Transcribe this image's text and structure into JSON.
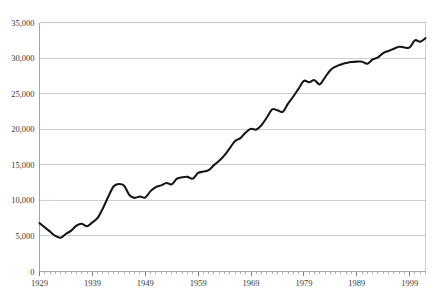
{
  "chart_data": {
    "type": "line",
    "title": "",
    "subtitle": "",
    "xlabel": "",
    "ylabel": "",
    "grid": "horizontal",
    "legend": "none",
    "xlim": [
      1929,
      2002
    ],
    "ylim": [
      0,
      35000
    ],
    "ytick_labels": [
      "0",
      "5,000",
      "10,000",
      "15,000",
      "20,000",
      "25,000",
      "30,000",
      "35,000"
    ],
    "ytick_values": [
      0,
      5000,
      10000,
      15000,
      20000,
      25000,
      30000,
      35000
    ],
    "xtick_labels": [
      "1929",
      "1939",
      "1949",
      "1959",
      "1969",
      "1979",
      "1989",
      "1999"
    ],
    "xtick_values": [
      1929,
      1939,
      1949,
      1959,
      1969,
      1979,
      1989,
      1999
    ],
    "minor_xtick_interval": 1,
    "series": [
      {
        "name": "Series 1",
        "color": "#151515",
        "x": [
          1929,
          1930,
          1931,
          1932,
          1933,
          1934,
          1935,
          1936,
          1937,
          1938,
          1939,
          1940,
          1941,
          1942,
          1943,
          1944,
          1945,
          1946,
          1947,
          1948,
          1949,
          1950,
          1951,
          1952,
          1953,
          1954,
          1955,
          1956,
          1957,
          1958,
          1959,
          1960,
          1961,
          1962,
          1963,
          1964,
          1965,
          1966,
          1967,
          1968,
          1969,
          1970,
          1971,
          1972,
          1973,
          1974,
          1975,
          1976,
          1977,
          1978,
          1979,
          1980,
          1981,
          1982,
          1983,
          1984,
          1985,
          1986,
          1987,
          1988,
          1989,
          1990,
          1991,
          1992,
          1993,
          1994,
          1995,
          1996,
          1997,
          1998,
          1999,
          2000,
          2001,
          2002
        ],
        "values": [
          6800,
          6150,
          5700,
          4900,
          4750,
          5250,
          5700,
          6450,
          6700,
          6400,
          6900,
          7500,
          8800,
          10400,
          11900,
          12350,
          12100,
          10700,
          10350,
          10600,
          10450,
          11350,
          11900,
          12150,
          12500,
          12300,
          13100,
          13300,
          13350,
          13100,
          13900,
          14100,
          14300,
          15000,
          15600,
          16400,
          17400,
          18400,
          18800,
          19600,
          20100,
          20000,
          20650,
          21700,
          22900,
          22700,
          22500,
          23700,
          24700,
          26000,
          26800,
          26600,
          27000,
          26300,
          27400,
          29300,
          30300,
          31300,
          32300,
          33600,
          34700,
          35200,
          34900,
          35900,
          36800,
          38200,
          39100,
          40600,
          42400,
          44200,
          46100,
          47300,
          47200,
          47900
        ],
        "values_note": "Plotted values are scaled to the chart axis; reading at axis gridlines: 1929 ~6,800; 1933 low ~4,750; 1944 peak ~12,300; 1947 trough ~10,350; 1959 ~13,900; 1969 ~20,100; 1979 ~26,800; 1982 dip ~26,300; 1989 ~29,500; 1991 dip ~29,200; 1999 ~31,500; 2001 dip ~32,300; 2002 ~32,800"
      }
    ],
    "plotted_points": {
      "x": [
        1929,
        1930,
        1931,
        1932,
        1933,
        1934,
        1935,
        1936,
        1937,
        1938,
        1939,
        1940,
        1941,
        1942,
        1943,
        1944,
        1945,
        1946,
        1947,
        1948,
        1949,
        1950,
        1951,
        1952,
        1953,
        1954,
        1955,
        1956,
        1957,
        1958,
        1959,
        1960,
        1961,
        1962,
        1963,
        1964,
        1965,
        1966,
        1967,
        1968,
        1969,
        1970,
        1971,
        1972,
        1973,
        1974,
        1975,
        1976,
        1977,
        1978,
        1979,
        1980,
        1981,
        1982,
        1983,
        1984,
        1985,
        1986,
        1987,
        1988,
        1989,
        1990,
        1991,
        1992,
        1993,
        1994,
        1995,
        1996,
        1997,
        1998,
        1999,
        2000,
        2001,
        2002
      ],
      "y": [
        6800,
        6200,
        5600,
        5000,
        4750,
        5300,
        5750,
        6450,
        6700,
        6350,
        6900,
        7550,
        8900,
        10500,
        11950,
        12300,
        12050,
        10750,
        10350,
        10550,
        10400,
        11300,
        11850,
        12100,
        12450,
        12250,
        13050,
        13250,
        13300,
        13050,
        13850,
        14050,
        14250,
        14950,
        15550,
        16350,
        17350,
        18350,
        18750,
        19550,
        20050,
        19950,
        20600,
        21650,
        22800,
        22650,
        22450,
        23600,
        24600,
        25700,
        26800,
        26600,
        26900,
        26300,
        27300,
        28300,
        28800,
        29100,
        29300,
        29450,
        29500,
        29500,
        29200,
        29800,
        30100,
        30700,
        31000,
        31300,
        31600,
        31500,
        31500,
        32500,
        32300,
        32800
      ]
    }
  },
  "axes": {
    "y_axis_name": "y-axis",
    "x_axis_name": "x-axis"
  }
}
